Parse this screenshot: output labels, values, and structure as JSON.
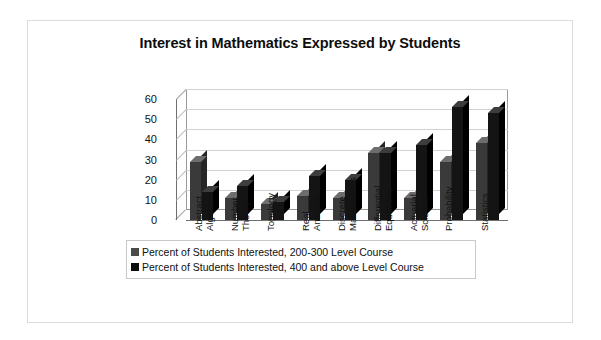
{
  "figure": {
    "title": "Interest in Mathematics Expressed by Students"
  },
  "chart_data": {
    "type": "bar",
    "title": "Interest in Mathematics Expressed by Students",
    "xlabel": "",
    "ylabel": "",
    "ylim": [
      0,
      60
    ],
    "yticks": [
      0,
      10,
      20,
      30,
      40,
      50,
      60
    ],
    "grid": true,
    "legend_position": "bottom",
    "style": "3d-clustered-column",
    "categories": [
      "Abstract Algebra",
      "Number Theory",
      "Topology",
      "Real Analysis",
      "Discrete Mathematics",
      "Differential Equations",
      "Actuarial Science",
      "Probability",
      "Statistics"
    ],
    "category_lines": [
      [
        "Abstract",
        "Algebra"
      ],
      [
        "Number",
        "Theory"
      ],
      [
        "Topology"
      ],
      [
        "Real",
        "Analysis"
      ],
      [
        "Discrete",
        "Mathematics"
      ],
      [
        "Differential",
        "Equations"
      ],
      [
        "Actuarial",
        "Science"
      ],
      [
        "Probability"
      ],
      [
        "Statistics"
      ]
    ],
    "series": [
      {
        "name": "Percent of Students Interested, 200-300 Level Course",
        "color": "#4a4a4a",
        "values": [
          29,
          11,
          8,
          12,
          11,
          33,
          11,
          29,
          38
        ]
      },
      {
        "name": "Percent of Students Interested, 400 and above Level Course",
        "color": "#0d0d0d",
        "values": [
          14,
          17,
          9,
          22,
          20,
          33,
          37,
          56,
          53
        ]
      }
    ]
  }
}
